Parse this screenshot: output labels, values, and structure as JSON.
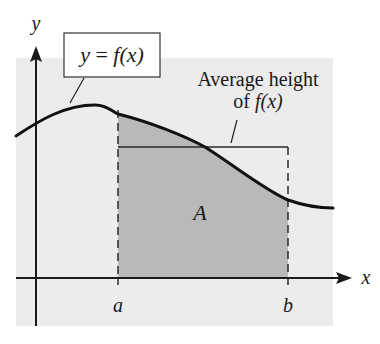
{
  "figure": {
    "type": "average-value-of-function-diagram",
    "colors": {
      "background": "#ffffff",
      "panel": "#ececec",
      "shaded_region": "#b9b9b9",
      "ink": "#1a1a1a"
    }
  },
  "axes": {
    "x_label": "x",
    "y_label": "y",
    "tick_a": "a",
    "tick_b": "b"
  },
  "curve": {
    "label": "y = f(x)",
    "label_parts": {
      "lhs": "y",
      "eq": " = ",
      "fn": "f",
      "arg": "(x)"
    }
  },
  "region": {
    "label": "A"
  },
  "average_height": {
    "line1": "Average height",
    "line2_prefix": "of ",
    "line2_fn": "f",
    "line2_arg": "(x)"
  }
}
